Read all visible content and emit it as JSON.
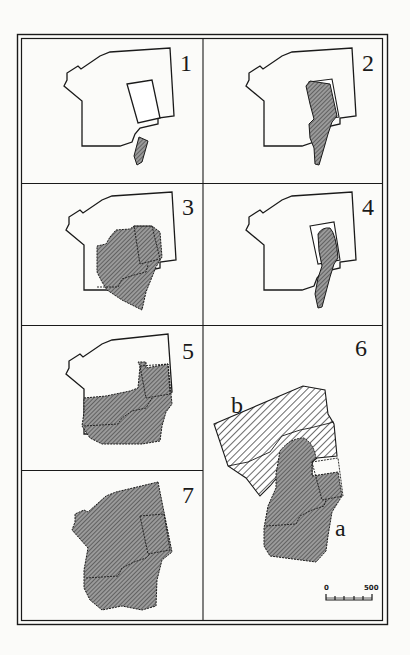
{
  "figure": {
    "panels": [
      {
        "id": "1",
        "label": "1"
      },
      {
        "id": "2",
        "label": "2"
      },
      {
        "id": "3",
        "label": "3"
      },
      {
        "id": "4",
        "label": "4"
      },
      {
        "id": "5",
        "label": "5"
      },
      {
        "id": "6",
        "label": "6"
      },
      {
        "id": "7",
        "label": "7"
      }
    ],
    "area_labels": {
      "a": "a",
      "b": "b"
    },
    "scale_bar": {
      "start": "0",
      "end": "500"
    },
    "colors": {
      "line": "#1a1a1a",
      "fill_gray": "#8d8d8d",
      "background": "#fbfbf9"
    }
  }
}
